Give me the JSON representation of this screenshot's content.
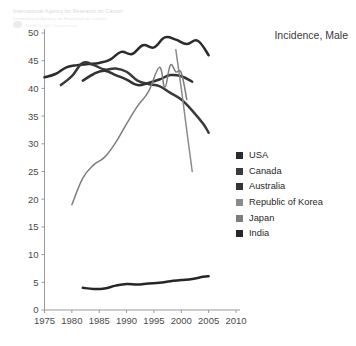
{
  "watermark": {
    "line1": "International Agency for Research on Cancer",
    "line2": "International Agency for Research on Cancer",
    "line3": "World Health Organization",
    "logo_icon": "iarc-logo-icon"
  },
  "chart_title": "Incidence, Male",
  "legend": {
    "position": "right",
    "items": [
      {
        "label": "USA",
        "color": "#2b2b2b"
      },
      {
        "label": "Canada",
        "color": "#3a3a3a"
      },
      {
        "label": "Australia",
        "color": "#333333"
      },
      {
        "label": "Republic of Korea",
        "color": "#8a8a8a"
      },
      {
        "label": "Japan",
        "color": "#7d7d7d"
      },
      {
        "label": "India",
        "color": "#262626"
      }
    ]
  },
  "chart_data": {
    "type": "line",
    "title": "Incidence, Male",
    "xlabel": "",
    "ylabel": "",
    "xlim": [
      1975,
      2010
    ],
    "ylim": [
      0,
      50
    ],
    "xticks": [
      1975,
      1980,
      1985,
      1990,
      1995,
      2000,
      2005,
      2010
    ],
    "yticks": [
      0,
      5,
      10,
      15,
      20,
      25,
      30,
      35,
      40,
      45,
      50
    ],
    "grid": false,
    "legend_position": "right",
    "series": [
      {
        "name": "USA",
        "color": "#2b2b2b",
        "x": [
          1975,
          1977,
          1979,
          1981,
          1983,
          1985,
          1987,
          1989,
          1991,
          1993,
          1995,
          1997,
          1999,
          2001,
          2003,
          2005
        ],
        "values": [
          42.0,
          42.6,
          43.8,
          44.2,
          44.4,
          44.6,
          45.2,
          46.6,
          46.2,
          47.8,
          47.4,
          49.2,
          48.8,
          48.0,
          48.6,
          46.0
        ]
      },
      {
        "name": "Canada",
        "color": "#3a3a3a",
        "x": [
          1978,
          1980,
          1982,
          1984,
          1986,
          1988,
          1990,
          1992,
          1994,
          1996,
          1998,
          2000,
          2002,
          2004,
          2005
        ],
        "values": [
          40.6,
          42.2,
          44.6,
          44.2,
          43.4,
          43.6,
          43.0,
          41.4,
          40.8,
          40.4,
          39.2,
          38.0,
          36.0,
          33.6,
          32.0
        ]
      },
      {
        "name": "Australia",
        "color": "#333333",
        "x": [
          1982,
          1984,
          1986,
          1988,
          1990,
          1992,
          1994,
          1996,
          1998,
          2000,
          2002
        ],
        "values": [
          41.4,
          42.6,
          43.2,
          42.4,
          41.6,
          40.6,
          41.0,
          41.6,
          42.4,
          42.2,
          41.2
        ]
      },
      {
        "name": "Republic of Korea",
        "color": "#8a8a8a",
        "x": [
          1999,
          2000,
          2001,
          2002
        ],
        "values": [
          47.0,
          40.0,
          32.4,
          25.0
        ]
      },
      {
        "name": "Japan",
        "color": "#7d7d7d",
        "x": [
          1980,
          1982,
          1984,
          1986,
          1988,
          1990,
          1992,
          1994,
          1996,
          1997,
          1998,
          1999,
          2000,
          2001
        ],
        "values": [
          19.0,
          23.8,
          26.2,
          27.6,
          30.2,
          33.6,
          36.8,
          39.4,
          43.8,
          40.2,
          44.2,
          43.0,
          42.8,
          38.0
        ]
      },
      {
        "name": "India",
        "color": "#262626",
        "x": [
          1982,
          1984,
          1986,
          1988,
          1990,
          1992,
          1994,
          1996,
          1998,
          2000,
          2002,
          2004,
          2005
        ],
        "values": [
          4.0,
          3.8,
          3.9,
          4.4,
          4.7,
          4.6,
          4.8,
          4.9,
          5.2,
          5.4,
          5.6,
          6.0,
          6.1
        ]
      }
    ]
  },
  "axes": {
    "color": "#9a9a9a",
    "tick_label_color": "#4a4a4a"
  }
}
